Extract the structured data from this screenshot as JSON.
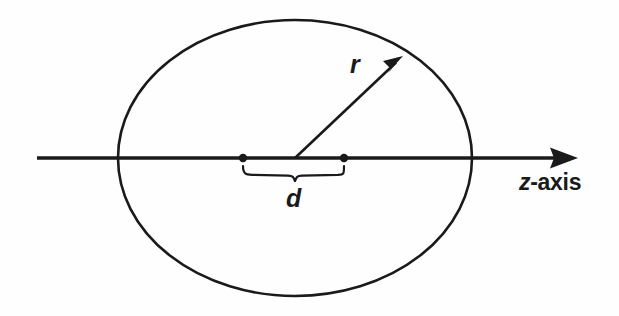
{
  "figure": {
    "name": "sphere-cross-section-on-z-axis",
    "background_color": "#fefefe",
    "ink_color": "#1a1a1a",
    "width": 619,
    "height": 316
  },
  "labels": {
    "radius": "r",
    "distance": "d",
    "axis_var": "z",
    "axis_rest": "-axis",
    "axis_full": "z-axis"
  },
  "diagram_data": {
    "type": "geometric-diagram",
    "description": "A circle (drawn as an ellipse) centered on a horizontal z-axis, with a radius arrow r from the center to the upper-right boundary, and a brace labeled d spanning between two marked points on the axis.",
    "elements": [
      {
        "name": "circle-outline",
        "shape": "ellipse",
        "cx": 295,
        "cy": 158,
        "rx": 177,
        "ry": 138,
        "stroke_width": 2.6,
        "fill": "none"
      },
      {
        "name": "z-axis-line",
        "shape": "arrow-line",
        "x1": 37,
        "y1": 158,
        "x2": 578,
        "y2": 158,
        "stroke_width": 3.4,
        "arrowhead": "end"
      },
      {
        "name": "radius-arrow",
        "shape": "arrow-line",
        "x1": 295,
        "y1": 158,
        "x2": 402,
        "y2": 57,
        "stroke_width": 2.6,
        "arrowhead": "end",
        "label": "r"
      },
      {
        "name": "left-axis-point",
        "shape": "dot",
        "cx": 243,
        "cy": 158,
        "r": 4.2
      },
      {
        "name": "right-axis-point",
        "shape": "dot",
        "cx": 344,
        "cy": 158,
        "r": 4.2
      },
      {
        "name": "distance-brace",
        "shape": "brace-down",
        "x_start": 243,
        "x_end": 344,
        "y_top": 166,
        "y_bottom": 181,
        "stroke_width": 2.2,
        "label": "d"
      }
    ],
    "annotations": [
      {
        "name": "radius-label",
        "text": "r",
        "x": 358,
        "y": 65,
        "style": "italic"
      },
      {
        "name": "distance-label",
        "text": "d",
        "x": 295,
        "y": 203,
        "style": "italic"
      },
      {
        "name": "axis-label",
        "text": "z-axis",
        "x": 519,
        "y": 183,
        "style": "italic-z-plus-upright"
      }
    ]
  }
}
